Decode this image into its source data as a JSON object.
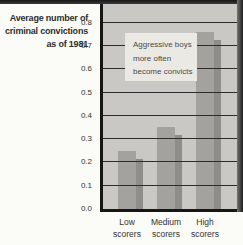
{
  "chart": {
    "title_lines": [
      "Average number of",
      "criminal convictions",
      "as of 1981"
    ],
    "annotation_lines": [
      "Aggressive boys",
      "more often",
      "become convicts"
    ]
  },
  "chart_data": {
    "type": "bar",
    "title": "Average number of criminal convictions as of 1981",
    "categories": [
      "Low scorers",
      "Medium scorers",
      "High scorers"
    ],
    "values": [
      0.25,
      0.35,
      0.76
    ],
    "annotation": "Aggressive boys more often become convicts",
    "xlabel": "",
    "ylabel": "Average number of criminal convictions as of 1981",
    "ylim": [
      0,
      0.88
    ],
    "yticks": [
      0.0,
      0.1,
      0.2,
      0.3,
      0.4,
      0.5,
      0.6,
      0.7,
      0.8
    ],
    "grid": true,
    "legend": false,
    "colors": {
      "page_bg": "#fbfbf8",
      "plot_bg": "#c9c8c4",
      "bar": "#a3a29e",
      "bar_shadow": "#8e8d89",
      "gridline": "#2c2c2c",
      "axis": "#161616",
      "annotation_bg": "#eae9e4"
    }
  }
}
